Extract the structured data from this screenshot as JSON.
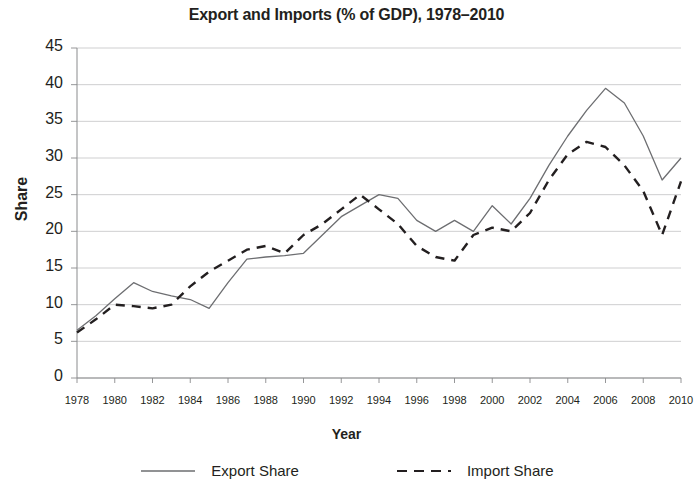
{
  "chart_data": {
    "type": "line",
    "title": "Export and Imports (% of GDP), 1978–2010",
    "xlabel": "Year",
    "ylabel": "Share",
    "xlim": [
      1978,
      2010
    ],
    "ylim": [
      0,
      45
    ],
    "ytick_step": 5,
    "grid": true,
    "legend_position": "bottom",
    "xtick_labels": [
      "1978",
      "1980",
      "1982",
      "1984",
      "1986",
      "1988",
      "1990",
      "1992",
      "1994",
      "1996",
      "1998",
      "2000",
      "2002",
      "2004",
      "2006",
      "2008",
      "2010"
    ],
    "ytick_labels": [
      "0",
      "5",
      "10",
      "15",
      "20",
      "25",
      "30",
      "35",
      "40",
      "45"
    ],
    "x": [
      1978,
      1979,
      1980,
      1981,
      1982,
      1983,
      1984,
      1985,
      1986,
      1987,
      1988,
      1989,
      1990,
      1991,
      1992,
      1993,
      1994,
      1995,
      1996,
      1997,
      1998,
      1999,
      2000,
      2001,
      2002,
      2003,
      2004,
      2005,
      2006,
      2007,
      2008,
      2009,
      2010
    ],
    "series": [
      {
        "name": "Export Share",
        "style": "solid",
        "color": "#6d6e71",
        "values": [
          6.5,
          8.5,
          10.8,
          13.0,
          11.8,
          11.2,
          10.7,
          9.5,
          13.0,
          16.2,
          16.5,
          16.7,
          17.0,
          19.5,
          22.0,
          23.5,
          25.0,
          24.5,
          21.5,
          20.0,
          21.5,
          20.0,
          23.5,
          21.0,
          24.5,
          29.0,
          33.0,
          36.5,
          39.5,
          37.5,
          33.0,
          27.0,
          30.0
        ]
      },
      {
        "name": "Import Share",
        "style": "dashed",
        "color": "#231f20",
        "values": [
          6.2,
          8.0,
          10.0,
          9.8,
          9.5,
          10.0,
          12.5,
          14.5,
          16.0,
          17.5,
          18.0,
          17.0,
          19.5,
          21.0,
          23.0,
          25.0,
          23.0,
          21.0,
          18.0,
          16.5,
          16.0,
          19.5,
          20.5,
          20.0,
          22.5,
          27.0,
          30.5,
          32.2,
          31.5,
          29.0,
          25.5,
          19.5,
          26.8
        ]
      }
    ]
  },
  "legend": {
    "entries": [
      {
        "label": "Export Share",
        "swatch": "solid-line-swatch"
      },
      {
        "label": "Import Share",
        "swatch": "dashed-line-swatch"
      }
    ]
  },
  "colors": {
    "export_line": "#6d6e71",
    "import_line": "#231f20",
    "grid": "#c9cacb",
    "axis": "#8a8b8d",
    "text": "#231f20",
    "background": "#ffffff"
  }
}
